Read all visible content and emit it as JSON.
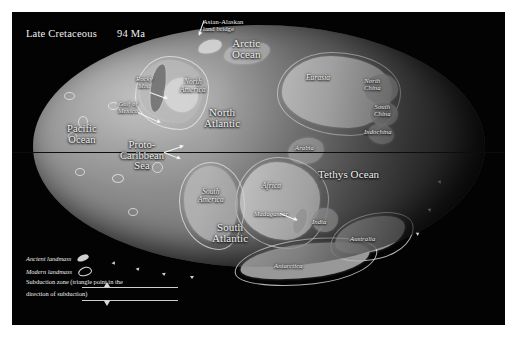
{
  "figure": {
    "title_era": "Late Cretaceous",
    "title_age": "94 Ma",
    "projection": "mollweide-globe",
    "background_color": "#030303",
    "ocean_color": "#8a8a8a",
    "land_color": "#b9b9b9",
    "label_color": "#f2f2f2",
    "equator_color": "#0d0d0d"
  },
  "oceans": [
    {
      "name": "arctic-ocean",
      "label": "Arctic\nOcean",
      "x": 232,
      "y": 38
    },
    {
      "name": "north-atlantic",
      "label": "North\nAtlantic",
      "x": 204,
      "y": 107
    },
    {
      "name": "pacific-ocean",
      "label": "Pacific\nOcean",
      "x": 67,
      "y": 124
    },
    {
      "name": "proto-caribbean-sea",
      "label": "Proto-\nCaribbean\nSea",
      "x": 120,
      "y": 140
    },
    {
      "name": "tethys-ocean",
      "label": "Tethys Ocean",
      "x": 330,
      "y": 164
    },
    {
      "name": "south-atlantic",
      "label": "South\nAtlantic",
      "x": 212,
      "y": 222
    }
  ],
  "continents": [
    {
      "name": "north-america",
      "label": "North\nAmerica",
      "x": 178,
      "y": 74
    },
    {
      "name": "eurasia",
      "label": "Eurasia",
      "x": 312,
      "y": 68
    },
    {
      "name": "north-china",
      "label": "North\nChina",
      "x": 364,
      "y": 73
    },
    {
      "name": "south-china",
      "label": "South\nChina",
      "x": 374,
      "y": 99
    },
    {
      "name": "indochina",
      "label": "Indochina",
      "x": 372,
      "y": 123
    },
    {
      "name": "arabia",
      "label": "Arabia",
      "x": 295,
      "y": 138
    },
    {
      "name": "africa",
      "label": "Africa",
      "x": 262,
      "y": 176
    },
    {
      "name": "south-america",
      "label": "South\nAmerica",
      "x": 199,
      "y": 184
    },
    {
      "name": "madagascar",
      "label": "Madagascar",
      "x": 265,
      "y": 204
    },
    {
      "name": "india",
      "label": "India",
      "x": 312,
      "y": 212
    },
    {
      "name": "australia",
      "label": "Australia",
      "x": 357,
      "y": 230
    },
    {
      "name": "antarctica",
      "label": "Antarctica",
      "x": 285,
      "y": 257
    }
  ],
  "callouts": [
    {
      "name": "asian-alaskan-land-bridge",
      "label": "Asian-Alaskan\nland bridge",
      "x": 203,
      "y": 11,
      "italic": false
    },
    {
      "name": "rocky-mountains",
      "label": "Rocky\nMts.",
      "x": 136,
      "y": 76,
      "italic": true
    },
    {
      "name": "gulf-of-mexico",
      "label": "Gulf of\nMexico",
      "x": 120,
      "y": 101,
      "italic": true
    }
  ],
  "legend": {
    "ancient_landmass": "Ancient landmass",
    "modern_landmass": "Modern landmass",
    "subduction_line1": "Subduction zone (triangle point in the",
    "subduction_line2": "direction of subduction)"
  }
}
